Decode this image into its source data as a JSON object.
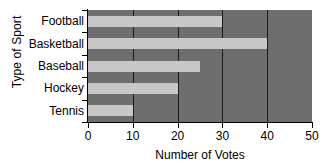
{
  "chart_data": {
    "type": "bar",
    "orientation": "horizontal",
    "title": "",
    "xlabel": "Number of Votes",
    "ylabel": "Type of Sport",
    "categories": [
      "Football",
      "Basketball",
      "Baseball",
      "Hockey",
      "Tennis"
    ],
    "values": [
      30,
      40,
      25,
      20,
      10
    ],
    "xlim": [
      0,
      50
    ],
    "xticks": [
      0,
      10,
      20,
      30,
      40,
      50
    ],
    "xtick_labels": [
      "0",
      "10",
      "20",
      "30",
      "40",
      "50"
    ],
    "grid": true,
    "grid_axis": "x",
    "legend": false,
    "colors": {
      "bar": "#c8c8c8",
      "plot_background": "#6e6e6e",
      "gridline": "#1a1a1a",
      "axis": "#000000",
      "text": "#000000",
      "figure_background": "#ffffff"
    }
  }
}
